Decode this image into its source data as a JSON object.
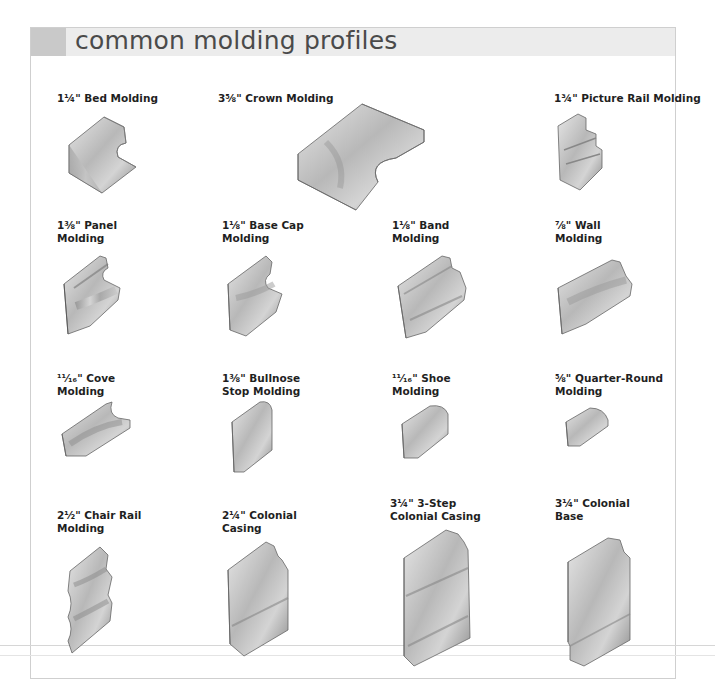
{
  "page": {
    "title": "common molding profiles",
    "colors": {
      "header_band": "#ececec",
      "header_accent": "#c9c9c9",
      "frame_border": "#cfcfcf",
      "title_text": "#4a4a4a",
      "wood_light": "#e2e2e2",
      "wood_mid": "#b3b3b3",
      "wood_dark": "#7d7d7d"
    }
  },
  "moldings": [
    {
      "id": "bed",
      "line1": "1¼\" Bed Molding",
      "line2": ""
    },
    {
      "id": "crown",
      "line1": "3⅝\" Crown Molding",
      "line2": ""
    },
    {
      "id": "picture-rail",
      "line1": "1¾\" Picture Rail Molding",
      "line2": ""
    },
    {
      "id": "panel",
      "line1": "1⅜\" Panel",
      "line2": "Molding"
    },
    {
      "id": "base-cap",
      "line1": "1⅛\" Base Cap",
      "line2": "Molding"
    },
    {
      "id": "band",
      "line1": "1⅛\" Band",
      "line2": "Molding"
    },
    {
      "id": "wall",
      "line1": "⅞\" Wall",
      "line2": "Molding"
    },
    {
      "id": "cove",
      "line1": "¹¹⁄₁₆\" Cove",
      "line2": "Molding"
    },
    {
      "id": "bullnose-stop",
      "line1": "1⅜\" Bullnose",
      "line2": "Stop Molding"
    },
    {
      "id": "shoe",
      "line1": "¹¹⁄₁₆\" Shoe",
      "line2": "Molding"
    },
    {
      "id": "quarter-round",
      "line1": "⅝\" Quarter-Round",
      "line2": "Molding"
    },
    {
      "id": "chair-rail",
      "line1": "2½\" Chair Rail",
      "line2": "Molding"
    },
    {
      "id": "colonial-casing",
      "line1": "2¼\" Colonial",
      "line2": "Casing"
    },
    {
      "id": "three-step-casing",
      "line1": "3¼\" 3-Step",
      "line2": "Colonial Casing"
    },
    {
      "id": "colonial-base",
      "line1": "3¼\" Colonial",
      "line2": "Base"
    }
  ]
}
